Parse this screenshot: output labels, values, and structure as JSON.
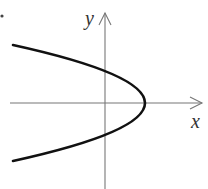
{
  "diagram": {
    "type": "parabola-graph",
    "equation_form": "x = c - y^2",
    "axes": {
      "x_label": "x",
      "y_label": "y",
      "color": "#777777",
      "origin_px": [
        105,
        103
      ],
      "x_axis_px": {
        "from": 10,
        "to": 203,
        "arrow": true
      },
      "y_axis_px": {
        "from": 189,
        "to": 12,
        "arrow": true
      }
    },
    "curve": {
      "color": "#111111",
      "stroke_width": 2.6,
      "vertex_px": [
        145,
        103
      ],
      "y_intercepts_px": [
        71.5,
        134.5
      ],
      "left_ends_px": [
        [
          13,
          45
        ],
        [
          13,
          160
        ]
      ],
      "opens": "left"
    },
    "marker_dot": {
      "position_px": [
        2,
        16
      ],
      "color": "#444444"
    }
  }
}
